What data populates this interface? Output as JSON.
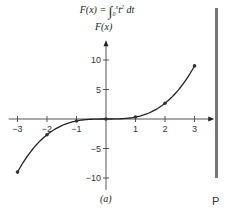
{
  "chart_data": {
    "type": "line",
    "title_parts": {
      "lhs": "F(x) =",
      "integral": "∫",
      "lower": "0",
      "upper": "x",
      "integrand": "t",
      "power": "2",
      "differential": "dt"
    },
    "xlabel": "",
    "ylabel": "F(x)",
    "caption": "(a)",
    "x_ticks": [
      -3,
      -2,
      -1,
      1,
      2,
      3
    ],
    "x_tick_labels": [
      "−3",
      "−2",
      "−1",
      "1",
      "2",
      "3"
    ],
    "y_ticks": [
      10,
      5,
      -5,
      -10
    ],
    "y_tick_labels": [
      "10",
      "5",
      "−5",
      "−10"
    ],
    "xlim": [
      -3.3,
      3.5
    ],
    "ylim": [
      -12,
      12.5
    ],
    "grid": false,
    "series": [
      {
        "name": "F(x)",
        "x": [
          -3,
          -2,
          -1,
          0,
          1,
          2,
          3
        ],
        "values": [
          -9,
          -2.67,
          -0.33,
          0,
          0.33,
          2.67,
          9
        ],
        "markers": true
      }
    ]
  },
  "side": {
    "letter": "P",
    "bar_color": "#777777"
  },
  "colors": {
    "line": "#222222",
    "axis": "#555555",
    "marker": "#333333"
  }
}
